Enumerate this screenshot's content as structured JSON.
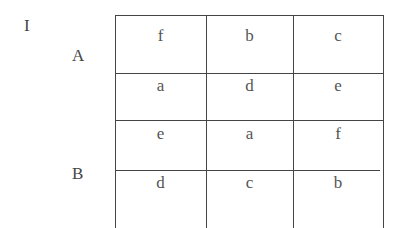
{
  "figure_label": "I",
  "groups": [
    {
      "label": "A",
      "rows": [
        [
          "f",
          "b",
          "c"
        ],
        [
          "a",
          "d",
          "e"
        ]
      ]
    },
    {
      "label": "B",
      "rows": [
        [
          "e",
          "a",
          "f"
        ],
        [
          "d",
          "c",
          "b"
        ]
      ]
    }
  ]
}
